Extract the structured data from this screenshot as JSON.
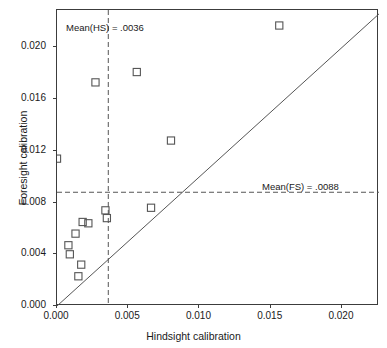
{
  "chart_data": {
    "type": "scatter",
    "title": "",
    "xlabel": "Hindsight calibration",
    "ylabel": "Foresight calibration",
    "xlim": [
      0.0,
      0.0226
    ],
    "ylim": [
      0.0,
      0.0229
    ],
    "xticks": [
      0.0,
      0.005,
      0.01,
      0.015,
      0.02
    ],
    "xticklabels": [
      "0.000",
      "0.005",
      "0.010",
      "0.015",
      "0.020"
    ],
    "yticks": [
      0.0,
      0.004,
      0.008,
      0.012,
      0.016,
      0.02
    ],
    "yticklabels": [
      "0.000",
      "0.004",
      "0.008",
      "0.012",
      "0.016",
      "0.020"
    ],
    "grid": false,
    "legend": null,
    "marker": "open-square",
    "marker_color": "#555555",
    "points": [
      {
        "x": 0.0,
        "y": 0.0114
      },
      {
        "x": 0.0008,
        "y": 0.0047
      },
      {
        "x": 0.0009,
        "y": 0.004
      },
      {
        "x": 0.0013,
        "y": 0.0056
      },
      {
        "x": 0.0018,
        "y": 0.0065
      },
      {
        "x": 0.0022,
        "y": 0.0064
      },
      {
        "x": 0.0017,
        "y": 0.0032
      },
      {
        "x": 0.0015,
        "y": 0.0023
      },
      {
        "x": 0.0027,
        "y": 0.0173
      },
      {
        "x": 0.0034,
        "y": 0.0074
      },
      {
        "x": 0.0035,
        "y": 0.0068
      },
      {
        "x": 0.0056,
        "y": 0.0181
      },
      {
        "x": 0.0066,
        "y": 0.0076
      },
      {
        "x": 0.008,
        "y": 0.0128
      },
      {
        "x": 0.0156,
        "y": 0.0217
      }
    ],
    "reference_line": {
      "type": "identity",
      "description": "y = x diagonal",
      "style": "solid"
    },
    "mean_lines": [
      {
        "name": "mean-hindsight",
        "orientation": "vertical",
        "value": 0.0036,
        "style": "dashed",
        "label": "Mean(HS) = .0036"
      },
      {
        "name": "mean-foresight",
        "orientation": "horizontal",
        "value": 0.0088,
        "style": "dashed",
        "label": "Mean(FS) = .0088"
      }
    ]
  },
  "annotations": {
    "hindsight_mean": "Mean(HS) = .0036",
    "foresight_mean": "Mean(FS) = .0088"
  },
  "axes": {
    "x_title": "Hindsight calibration",
    "y_title": "Foresight calibration"
  },
  "colors": {
    "frame": "#3c3c3c",
    "marker": "#555555",
    "dashed": "#555555",
    "text": "#1a1a1a"
  }
}
